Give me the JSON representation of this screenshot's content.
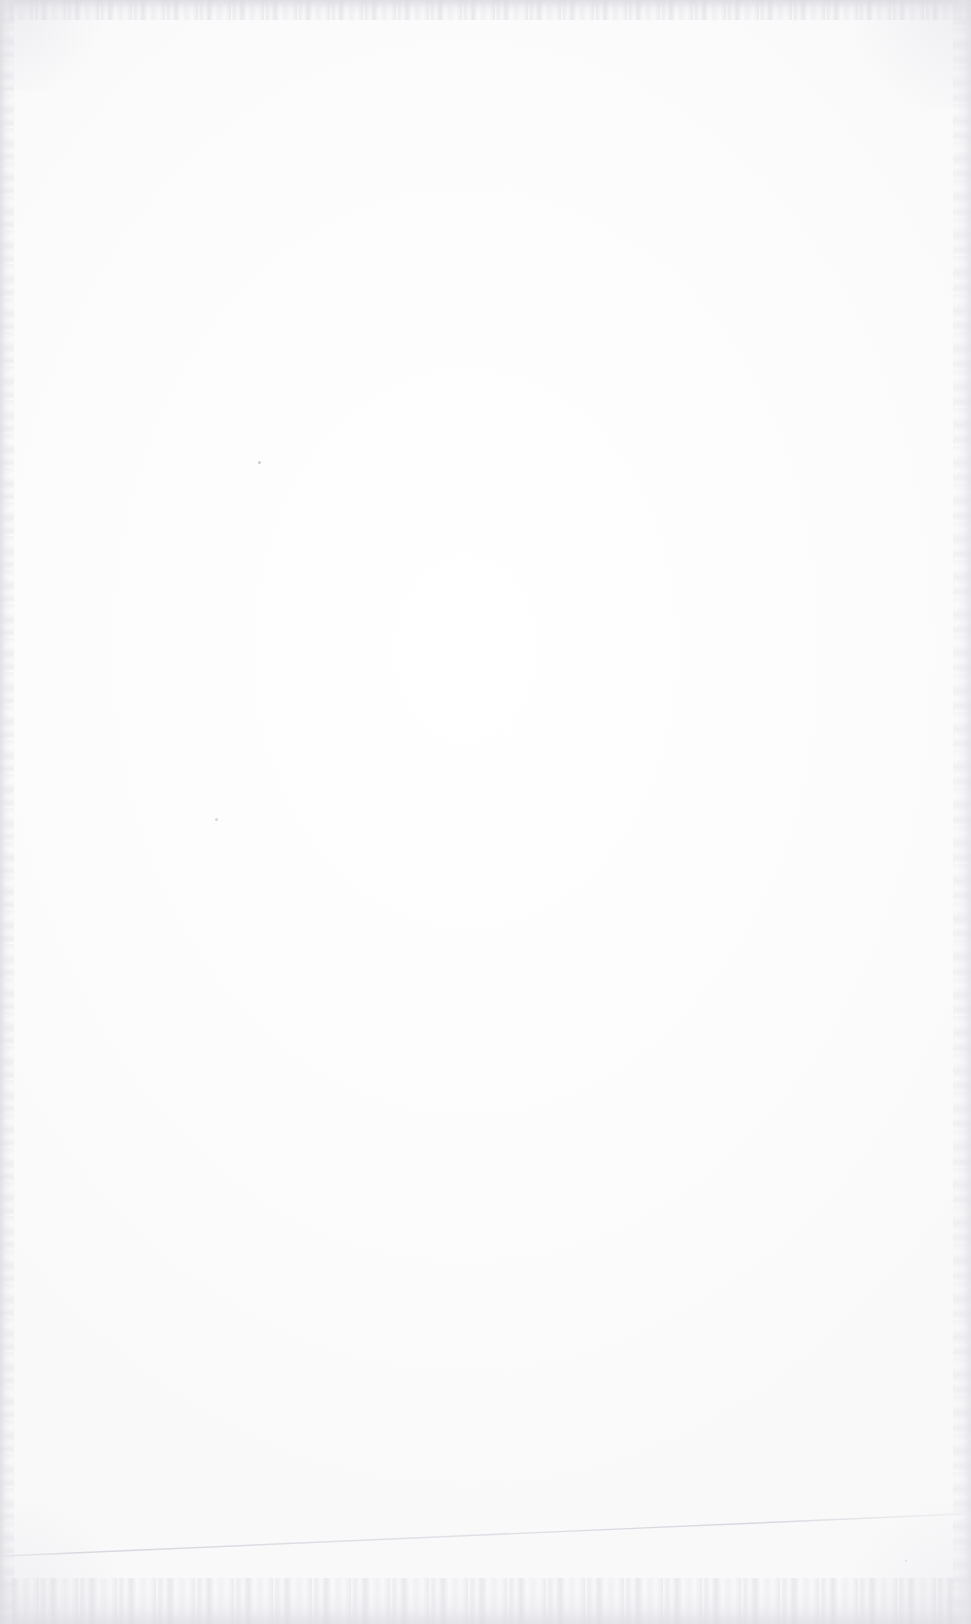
{
  "document": {
    "kind": "scanned-blank-page",
    "page_width_px": 971,
    "page_height_px": 1624,
    "paper_color": "#fefefe",
    "visible_text": "",
    "text_blocks": [],
    "headings": [],
    "has_content": false,
    "description": "Blank scanned sheet of paper with no printed text, headings, figures or tables."
  },
  "artifacts": {
    "edge_noise_color": "#e0e0e5",
    "vignette_color": "#d8d8de",
    "top_band_height_px": 20,
    "bottom_band_height_px": 46,
    "left_band_width_px": 14,
    "right_band_width_px": 18
  },
  "sheet_edge_line": {
    "name": "paper-edge-hairline",
    "color": "#dcdce2",
    "stroke_width_px": 1.4,
    "x1": 4,
    "y1": 44,
    "x2": 962,
    "y2": 2,
    "note": "Faint skewed line across the lower portion of the scan."
  },
  "dust_specks": [
    {
      "x": 258,
      "y": 461,
      "size": 3,
      "color": "#b9b9c0"
    },
    {
      "x": 215,
      "y": 818,
      "size": 3,
      "color": "#c2c2c9"
    },
    {
      "x": 905,
      "y": 1560,
      "size": 2,
      "color": "#cccbd2"
    }
  ]
}
